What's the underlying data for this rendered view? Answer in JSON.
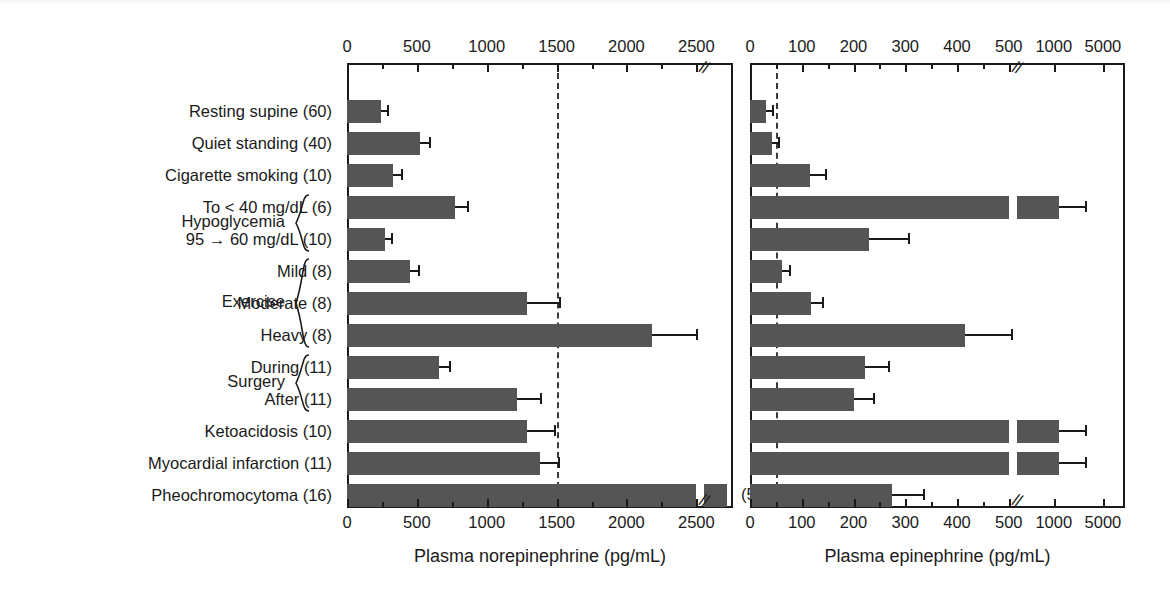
{
  "chart_data": {
    "type": "bar",
    "orientation": "horizontal",
    "title": "",
    "categories": [
      "Resting supine (60)",
      "Quiet standing (40)",
      "Cigarette smoking (10)",
      "To < 40 mg/dL (6)",
      "95 → 60 mg/dL (10)",
      "Mild (8)",
      "Moderate (8)",
      "Heavy (8)",
      "During (11)",
      "After (11)",
      "Ketoacidosis (10)",
      "Myocardial infarction (11)",
      "Pheochromocytoma (16)"
    ],
    "group_braces": [
      {
        "name": "Hypoglycemia",
        "first_row": 3,
        "last_row": 4
      },
      {
        "name": "Exercise",
        "first_row": 5,
        "last_row": 7
      },
      {
        "name": "Surgery",
        "first_row": 8,
        "last_row": 9
      }
    ],
    "panels": [
      {
        "id": "norepinephrine",
        "xlabel": "Plasma norepinephrine (pg/mL)",
        "tick_labels": [
          "0",
          "500",
          "1000",
          "1500",
          "2000",
          "2500"
        ],
        "tick_values": [
          0,
          500,
          1000,
          1500,
          2000,
          2500
        ],
        "minor_tick_values": [
          250,
          750,
          1250,
          1750,
          2250
        ],
        "axis_break_after": 2500,
        "reference_line": 1500,
        "xlim": [
          0,
          2500
        ],
        "values": [
          240,
          520,
          330,
          770,
          270,
          450,
          1290,
          2180,
          660,
          1220,
          1290,
          1380,
          2700
        ],
        "errors": [
          40,
          70,
          55,
          90,
          45,
          60,
          230,
          320,
          70,
          160,
          190,
          130,
          0
        ],
        "annotations": [
          {
            "row": 12,
            "text": "(5310)"
          }
        ]
      },
      {
        "id": "epinephrine",
        "xlabel": "Plasma epinephrine (pg/mL)",
        "tick_labels": [
          "0",
          "100",
          "200",
          "300",
          "400",
          "500",
          "1000",
          "5000"
        ],
        "tick_values": [
          0,
          100,
          200,
          300,
          400,
          500,
          1000,
          5000
        ],
        "minor_tick_values": [
          50,
          150,
          250,
          350,
          450
        ],
        "axis_break_after": 500,
        "reference_line": 50,
        "xlim": [
          0,
          500
        ],
        "values": [
          30,
          42,
          115,
          980,
          230,
          62,
          118,
          415,
          222,
          200,
          510,
          1020,
          275
        ],
        "errors": [
          6,
          5,
          30,
          90,
          75,
          14,
          22,
          90,
          45,
          38,
          60,
          55,
          60
        ],
        "annotations": []
      }
    ]
  },
  "colors": {
    "bar": "#555555",
    "axis": "#1a1a1a",
    "reference_line": "#3a3a3a",
    "background": "#ffffff"
  },
  "icons": {
    "axis_break": "axis-break-icon"
  }
}
